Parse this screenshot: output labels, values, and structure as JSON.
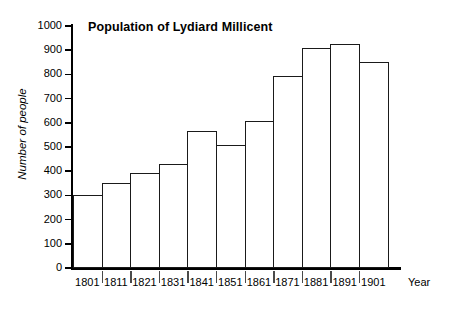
{
  "chart_data": {
    "type": "bar",
    "title": "Population of Lydiard Millicent",
    "xlabel": "Year",
    "ylabel": "Number of people",
    "categories": [
      "1801",
      "1811",
      "1821",
      "1831",
      "1841",
      "1851",
      "1861",
      "1871",
      "1881",
      "1891",
      "1901"
    ],
    "values": [
      300,
      352,
      394,
      428,
      565,
      508,
      606,
      795,
      908,
      925,
      850
    ],
    "ylim": [
      0,
      1000
    ],
    "yticks": [
      0,
      100,
      200,
      300,
      400,
      500,
      600,
      700,
      800,
      900,
      1000
    ],
    "ytick_labels": [
      "0",
      "100",
      "200",
      "300",
      "400",
      "500",
      "600",
      "700",
      "800",
      "900",
      "1000"
    ],
    "grid": false,
    "legend": "none",
    "bar_fill_color": "#ffffff",
    "bar_edge_color": "#1a1a1a",
    "axis_color": "#000000",
    "background_color": "#ffffff"
  }
}
